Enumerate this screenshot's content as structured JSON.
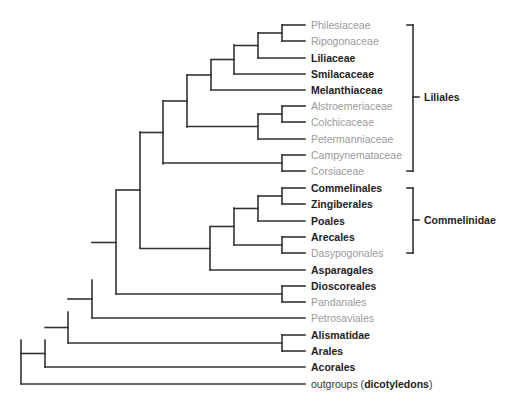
{
  "diagram": {
    "type": "phylogenetic-tree",
    "colors": {
      "line": "#333333",
      "bold_text": "#222222",
      "gray_text": "#9a9a9a"
    },
    "leaves": [
      {
        "id": "philesiaceae",
        "label": "Philesiaceae",
        "style": "gray",
        "y": 25
      },
      {
        "id": "ripogonaceae",
        "label": "Ripogonaceae",
        "style": "gray",
        "y": 41
      },
      {
        "id": "liliaceae",
        "label": "Liliaceae",
        "style": "bold",
        "y": 58
      },
      {
        "id": "smilacaceae",
        "label": "Smilacaceae",
        "style": "bold",
        "y": 74
      },
      {
        "id": "melanthiaceae",
        "label": "Melanthiaceae",
        "style": "bold",
        "y": 90
      },
      {
        "id": "alstroemeriaceae",
        "label": "Alstroemeriaceae",
        "style": "gray",
        "y": 106
      },
      {
        "id": "colchicaceae",
        "label": "Colchicaceae",
        "style": "gray",
        "y": 122
      },
      {
        "id": "petermanniaceae",
        "label": "Petermanniaceae",
        "style": "gray",
        "y": 139
      },
      {
        "id": "campynemataceae",
        "label": "Campynemataceae",
        "style": "gray",
        "y": 155
      },
      {
        "id": "corsiaceae",
        "label": "Corsiaceae",
        "style": "gray",
        "y": 171
      },
      {
        "id": "commelinales",
        "label": "Commelinales",
        "style": "bold",
        "y": 188
      },
      {
        "id": "zingiberales",
        "label": "Zingiberales",
        "style": "bold",
        "y": 204
      },
      {
        "id": "poales",
        "label": "Poales",
        "style": "bold",
        "y": 221
      },
      {
        "id": "arecales",
        "label": "Arecales",
        "style": "bold",
        "y": 237
      },
      {
        "id": "dasypogonales",
        "label": "Dasypogonales",
        "style": "gray",
        "y": 253
      },
      {
        "id": "asparagales",
        "label": "Asparagales",
        "style": "bold",
        "y": 270
      },
      {
        "id": "dioscoreales",
        "label": "Dioscoreales",
        "style": "bold",
        "y": 286
      },
      {
        "id": "pandanales",
        "label": "Pandanales",
        "style": "gray",
        "y": 302
      },
      {
        "id": "petrosaviales",
        "label": "Petrosaviales",
        "style": "gray",
        "y": 318
      },
      {
        "id": "alismatidae",
        "label": "Alismatidae",
        "style": "bold",
        "y": 335
      },
      {
        "id": "arales",
        "label": "Arales",
        "style": "bold",
        "y": 351
      },
      {
        "id": "acorales",
        "label": "Acorales",
        "style": "bold",
        "y": 367
      }
    ],
    "outgroup": {
      "prefix": "outgroups (",
      "bold": "dicotyledons",
      "suffix": ")",
      "y": 384
    },
    "groups": [
      {
        "id": "liliales",
        "label": "Liliales",
        "y_top": 25,
        "y_bottom": 171,
        "y_mid": 97
      },
      {
        "id": "commelinidae",
        "label": "Commelinidae",
        "y_top": 188,
        "y_bottom": 253,
        "y_mid": 220
      }
    ],
    "tip_x": 305,
    "label_x": 311,
    "nodes": [
      {
        "x": 282,
        "y_top": 25,
        "y_bottom": 41,
        "parent_x": 258
      },
      {
        "x": 258,
        "y_top": 33,
        "y_bottom": 58,
        "parent_x": 234
      },
      {
        "x": 234,
        "y_top": 45,
        "y_bottom": 74,
        "parent_x": 211
      },
      {
        "x": 211,
        "y_top": 60,
        "y_bottom": 90,
        "parent_x": 187
      },
      {
        "x": 282,
        "y_top": 106,
        "y_bottom": 122,
        "parent_x": 258
      },
      {
        "x": 258,
        "y_top": 114,
        "y_bottom": 139,
        "parent_x": 187
      },
      {
        "x": 187,
        "y_top": 75,
        "y_bottom": 127,
        "parent_x": 163
      },
      {
        "x": 282,
        "y_top": 155,
        "y_bottom": 171,
        "parent_x": 163
      },
      {
        "x": 163,
        "y_top": 101,
        "y_bottom": 164,
        "parent_x": 140
      },
      {
        "x": 282,
        "y_top": 188,
        "y_bottom": 204,
        "parent_x": 258
      },
      {
        "x": 258,
        "y_top": 196,
        "y_bottom": 221,
        "parent_x": 234
      },
      {
        "x": 282,
        "y_top": 237,
        "y_bottom": 253,
        "parent_x": 234
      },
      {
        "x": 234,
        "y_top": 208,
        "y_bottom": 245,
        "parent_x": 210
      },
      {
        "x": 210,
        "y_top": 227,
        "y_bottom": 270,
        "parent_x": 140
      },
      {
        "x": 140,
        "y_top": 132,
        "y_bottom": 248,
        "parent_x": 116
      },
      {
        "x": 282,
        "y_top": 286,
        "y_bottom": 302,
        "parent_x": 116
      },
      {
        "x": 116,
        "y_top": 191,
        "y_bottom": 294,
        "parent_x": 92
      },
      {
        "x": 92,
        "y_top": 280,
        "y_bottom": 318,
        "parent_x": 68
      },
      {
        "x": 282,
        "y_top": 335,
        "y_bottom": 351,
        "parent_x": 68
      },
      {
        "x": 68,
        "y_top": 312,
        "y_bottom": 343,
        "parent_x": 45
      },
      {
        "x": 45,
        "y_top": 340,
        "y_bottom": 367,
        "parent_x": 21
      },
      {
        "x": 21,
        "y_top": 340,
        "y_bottom": 384,
        "parent_x": null
      }
    ],
    "tip_branches": [
      {
        "from_x": 282,
        "y": 25
      },
      {
        "from_x": 282,
        "y": 41
      },
      {
        "from_x": 258,
        "y": 58
      },
      {
        "from_x": 234,
        "y": 74
      },
      {
        "from_x": 211,
        "y": 90
      },
      {
        "from_x": 282,
        "y": 106
      },
      {
        "from_x": 282,
        "y": 122
      },
      {
        "from_x": 258,
        "y": 139
      },
      {
        "from_x": 282,
        "y": 155
      },
      {
        "from_x": 282,
        "y": 171
      },
      {
        "from_x": 282,
        "y": 188
      },
      {
        "from_x": 282,
        "y": 204
      },
      {
        "from_x": 258,
        "y": 221
      },
      {
        "from_x": 282,
        "y": 237
      },
      {
        "from_x": 282,
        "y": 253
      },
      {
        "from_x": 210,
        "y": 270
      },
      {
        "from_x": 282,
        "y": 286
      },
      {
        "from_x": 282,
        "y": 302
      },
      {
        "from_x": 92,
        "y": 318
      },
      {
        "from_x": 282,
        "y": 335
      },
      {
        "from_x": 282,
        "y": 351
      },
      {
        "from_x": 45,
        "y": 367
      },
      {
        "from_x": 21,
        "y": 384
      }
    ]
  }
}
